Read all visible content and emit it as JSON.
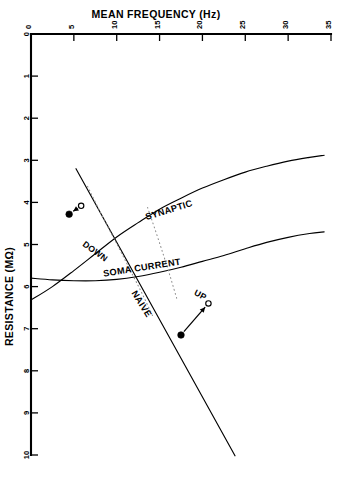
{
  "chart_data": {
    "type": "line",
    "title": "MEAN FREQUENCY (Hz)",
    "xlabel": "MEAN FREQUENCY (Hz)",
    "ylabel": "RESISTANCE (MΩ)",
    "xlim": [
      0,
      35
    ],
    "ylim": [
      0,
      10
    ],
    "y_axis_inverted": true,
    "x_axis_position": "top",
    "grid": false,
    "legend": "inline-curve-labels",
    "xticks": [
      0,
      5,
      10,
      15,
      20,
      25,
      30,
      35
    ],
    "xtick_labels": [
      "0",
      "5",
      "10",
      "15",
      "20",
      "25",
      "30",
      "35"
    ],
    "yticks": [
      0,
      1,
      2,
      3,
      4,
      5,
      6,
      7,
      8,
      9,
      10
    ],
    "ytick_labels": [
      "0",
      "1",
      "2",
      "3",
      "4",
      "5",
      "6",
      "7",
      "8",
      "9",
      "10"
    ],
    "series": [
      {
        "name": "SYNAPTIC",
        "style": "solid",
        "label": "SYNAPTIC",
        "label_x": 16.2,
        "label_y": 4.25,
        "label_rotation": -17,
        "points": [
          {
            "x": 0.0,
            "y": 6.32
          },
          {
            "x": 2.5,
            "y": 6.0
          },
          {
            "x": 5.0,
            "y": 5.62
          },
          {
            "x": 7.5,
            "y": 5.22
          },
          {
            "x": 10.0,
            "y": 4.82
          },
          {
            "x": 12.5,
            "y": 4.48
          },
          {
            "x": 15.0,
            "y": 4.16
          },
          {
            "x": 17.5,
            "y": 3.9
          },
          {
            "x": 20.0,
            "y": 3.66
          },
          {
            "x": 22.5,
            "y": 3.46
          },
          {
            "x": 25.0,
            "y": 3.28
          },
          {
            "x": 27.5,
            "y": 3.14
          },
          {
            "x": 30.0,
            "y": 3.02
          },
          {
            "x": 32.5,
            "y": 2.93
          },
          {
            "x": 34.2,
            "y": 2.88
          }
        ]
      },
      {
        "name": "SOMA CURRENT",
        "style": "solid",
        "label": "SOMA CURRENT",
        "label_x": 13.0,
        "label_y": 5.62,
        "label_rotation": -9,
        "points": [
          {
            "x": 0.0,
            "y": 5.8
          },
          {
            "x": 2.5,
            "y": 5.84
          },
          {
            "x": 5.0,
            "y": 5.86
          },
          {
            "x": 7.5,
            "y": 5.86
          },
          {
            "x": 10.0,
            "y": 5.83
          },
          {
            "x": 12.5,
            "y": 5.76
          },
          {
            "x": 15.0,
            "y": 5.66
          },
          {
            "x": 17.5,
            "y": 5.54
          },
          {
            "x": 20.0,
            "y": 5.4
          },
          {
            "x": 22.5,
            "y": 5.26
          },
          {
            "x": 25.0,
            "y": 5.1
          },
          {
            "x": 27.5,
            "y": 4.95
          },
          {
            "x": 30.0,
            "y": 4.83
          },
          {
            "x": 32.5,
            "y": 4.74
          },
          {
            "x": 34.2,
            "y": 4.7
          }
        ]
      },
      {
        "name": "NAIVE",
        "style": "solid",
        "label": "NAIVE",
        "label_x": 12.6,
        "label_y": 6.45,
        "label_rotation": 58,
        "points": [
          {
            "x": 5.25,
            "y": 3.2
          },
          {
            "x": 23.8,
            "y": 10.02
          }
        ]
      },
      {
        "name": "naive-dotted-band",
        "style": "dotted",
        "label": "",
        "points": [
          {
            "x": 6.6,
            "y": 3.62
          },
          {
            "x": 8.4,
            "y": 4.36
          },
          {
            "x": 10.1,
            "y": 5.02
          },
          {
            "x": 11.6,
            "y": 5.62
          },
          {
            "x": 13.0,
            "y": 6.18
          },
          {
            "x": 14.2,
            "y": 6.7
          }
        ]
      },
      {
        "name": "soma-dotted-band",
        "style": "dotted",
        "points": [
          {
            "x": 13.6,
            "y": 4.12
          },
          {
            "x": 14.6,
            "y": 4.72
          },
          {
            "x": 15.5,
            "y": 5.28
          },
          {
            "x": 16.3,
            "y": 5.8
          },
          {
            "x": 17.0,
            "y": 6.28
          }
        ]
      }
    ],
    "annotations": [
      {
        "name": "DOWN",
        "label": "DOWN",
        "label_x": 7.3,
        "label_y": 5.22,
        "label_rotation": 36,
        "from": {
          "x": 5.85,
          "y": 4.08,
          "marker": "open"
        },
        "to": {
          "x": 4.45,
          "y": 4.28,
          "marker": "filled"
        }
      },
      {
        "name": "UP",
        "label": "UP",
        "label_x": 19.6,
        "label_y": 6.26,
        "label_rotation": 28,
        "from": {
          "x": 17.5,
          "y": 7.15,
          "marker": "filled"
        },
        "to": {
          "x": 20.7,
          "y": 6.4,
          "marker": "open"
        }
      }
    ]
  }
}
